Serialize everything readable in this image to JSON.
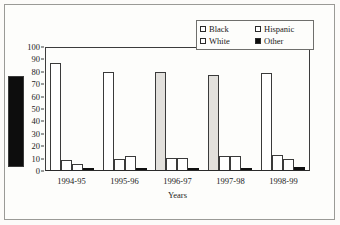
{
  "frame": {
    "note": "scanned figure border"
  },
  "chart_data": {
    "type": "bar",
    "title": "",
    "xlabel": "Years",
    "ylabel": "",
    "categories": [
      "1994-95",
      "1995-96",
      "1996-97",
      "1997-98",
      "1998-99"
    ],
    "ylim": [
      0,
      100
    ],
    "yticks": [
      0,
      10,
      20,
      30,
      40,
      50,
      60,
      70,
      80,
      90,
      100
    ],
    "grid": false,
    "legend_position": "top-right",
    "series": [
      {
        "name": "Black",
        "values": [
          86,
          79,
          79,
          77,
          78
        ],
        "swatch": "open"
      },
      {
        "name": "White",
        "values": [
          8,
          9,
          10,
          11,
          12
        ],
        "swatch": "open"
      },
      {
        "name": "Hispanic",
        "values": [
          5,
          11,
          10,
          11,
          9
        ],
        "swatch": "open"
      },
      {
        "name": "Other",
        "values": [
          1,
          1,
          1.5,
          1.5,
          2.5
        ],
        "swatch": "filled"
      }
    ]
  },
  "legend": {
    "entries": [
      {
        "label": "Black"
      },
      {
        "label": "Hispanic"
      },
      {
        "label": "White"
      },
      {
        "label": "Other"
      }
    ]
  },
  "colors": {
    "axis": "#3c3c3c",
    "bar_outline": "#3a3a3a",
    "bar_fill_open": "#ffffff",
    "bar_fill_other": "#0d0d0d",
    "bar_fill_shaded": "#e2e0dc",
    "paper": "#fdfdfb"
  }
}
